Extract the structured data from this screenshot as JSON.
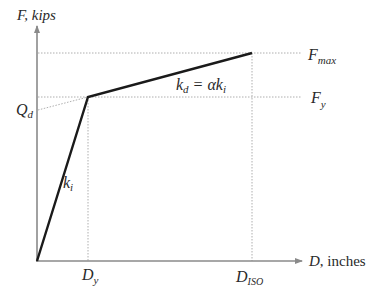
{
  "diagram": {
    "type": "bilinear force-displacement curve",
    "y_axis": {
      "symbol": "F",
      "unit": ", kips"
    },
    "x_axis": {
      "symbol": "D",
      "unit": ", inches"
    },
    "labels": {
      "Fmax_main": "F",
      "Fmax_sub": "max",
      "Fy_main": "F",
      "Fy_sub": "y",
      "Qd_main": "Q",
      "Qd_sub": "d",
      "Dy_main": "D",
      "Dy_sub": "y",
      "Diso_main": "D",
      "Diso_sub": "ISO",
      "ki_main": "k",
      "ki_sub": "i",
      "kd_main": "k",
      "kd_sub": "d",
      "kd_eq": " = αk",
      "kd_eq_sub": "i"
    },
    "colors": {
      "axis": "#8a8a8a",
      "curve": "#1a1a1a",
      "guide": "#9a9a9a",
      "text": "#2a2a2a"
    }
  }
}
